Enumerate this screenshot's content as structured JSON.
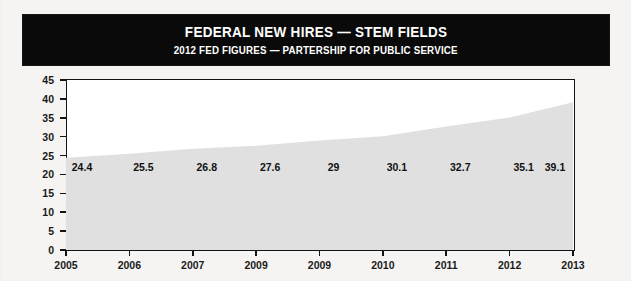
{
  "header": {
    "title": "FEDERAL NEW HIRES — STEM FIELDS",
    "subtitle": "2012 FED FIGURES — PARTERSHIP FOR PUBLIC SERVICE"
  },
  "colors": {
    "banner_background": "#0a0a0a",
    "banner_text": "#ffffff",
    "area_fill": "#e0e0e0",
    "axis": "#141414",
    "page_background": "#f5f4f2",
    "plot_background": "#ffffff"
  },
  "chart_data": {
    "type": "area",
    "title": "FEDERAL NEW HIRES — STEM FIELDS",
    "subtitle": "2012 FED FIGURES — PARTERSHIP FOR PUBLIC SERVICE",
    "xlabel": "",
    "ylabel": "",
    "categories": [
      "2005",
      "2006",
      "2007",
      "2009",
      "2009",
      "2010",
      "2011",
      "2012",
      "2013"
    ],
    "values": [
      24.4,
      25.5,
      26.8,
      27.6,
      29,
      30.1,
      32.7,
      35.1,
      39.1
    ],
    "value_labels": [
      "24.4",
      "25.5",
      "26.8",
      "27.6",
      "29",
      "30.1",
      "32.7",
      "35.1",
      "39.1"
    ],
    "ylim": [
      0,
      45
    ],
    "ytick_labels": [
      "0",
      "5",
      "10",
      "15",
      "20",
      "25",
      "30",
      "35",
      "40",
      "45"
    ],
    "ytick_values": [
      0,
      5,
      10,
      15,
      20,
      25,
      30,
      35,
      40,
      45
    ],
    "grid": false,
    "legend": "none",
    "value_label_y": 22
  }
}
